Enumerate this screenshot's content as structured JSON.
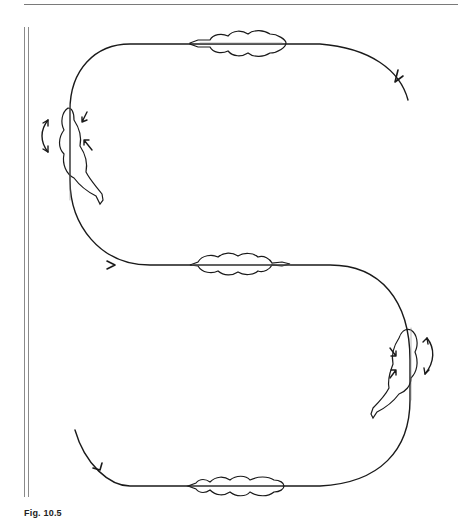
{
  "figure": {
    "label": "Fig. 10.5",
    "caption_visible": "Fig. 10.5  ...",
    "path": {
      "type": "serpentine",
      "loops": 3,
      "direction_arrows": 4
    },
    "horse_positions": [
      {
        "id": "top-straight",
        "orientation": "horizontal"
      },
      {
        "id": "left-turn",
        "orientation": "vertical",
        "bend": "left"
      },
      {
        "id": "middle-straight",
        "orientation": "horizontal"
      },
      {
        "id": "right-turn",
        "orientation": "vertical",
        "bend": "right"
      },
      {
        "id": "bottom-straight",
        "orientation": "horizontal"
      }
    ],
    "colors": {
      "line": "#1a1a1a",
      "rule": "#7a7a7a",
      "background": "#ffffff"
    }
  }
}
